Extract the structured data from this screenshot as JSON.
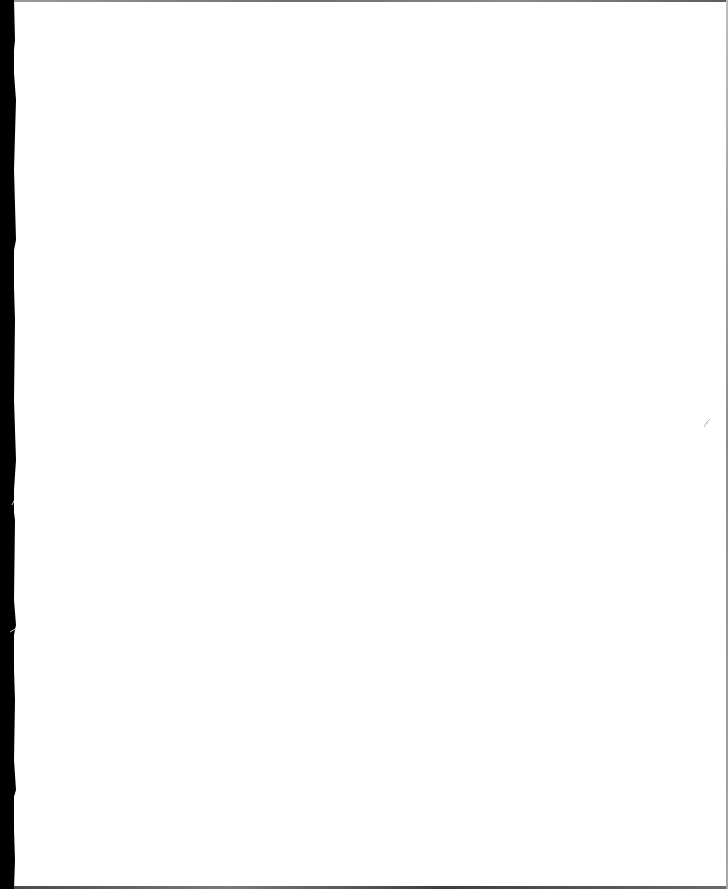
{
  "document": {
    "type": "blank-scanned-page",
    "text": "",
    "colors": {
      "paper": "#ffffff",
      "scanner_edge": "#000000",
      "border": "#7a7a7a"
    }
  }
}
